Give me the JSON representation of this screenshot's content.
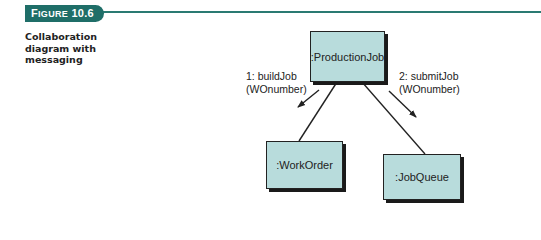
{
  "figure": {
    "badge_prefix": "F",
    "badge_small_caps": "IGURE",
    "badge_number": " 10.6",
    "caption": "Collaboration diagram with messaging"
  },
  "diagram": {
    "objects": [
      {
        "id": "production-job",
        "label": ":ProductionJob"
      },
      {
        "id": "work-order",
        "label": ":WorkOrder"
      },
      {
        "id": "job-queue",
        "label": ":JobQueue"
      }
    ],
    "messages": [
      {
        "label_line1": "1: buildJob",
        "label_line2": "(WOnumber)",
        "from": "production-job",
        "to": "work-order"
      },
      {
        "label_line1": "2: submitJob",
        "label_line2": "(WOnumber)",
        "from": "production-job",
        "to": "job-queue"
      }
    ]
  },
  "colors": {
    "accent": "#1f6e68",
    "box_fill": "#b8dcdc",
    "line": "#222222"
  }
}
